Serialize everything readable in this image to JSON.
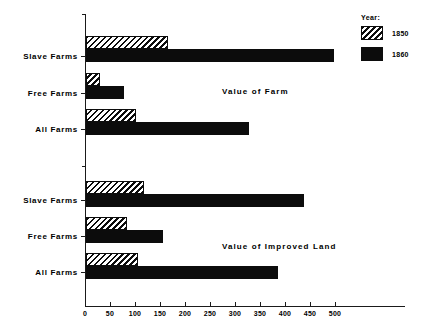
{
  "chart_data": {
    "type": "bar",
    "orientation": "horizontal",
    "title": "",
    "xlabel": "",
    "ylabel": "",
    "xlim": [
      0,
      515
    ],
    "grid": false,
    "legend": {
      "title": "Year:",
      "position": "top-right",
      "entries": [
        {
          "name": "1850",
          "pattern": "diagonal-hatch"
        },
        {
          "name": "1860",
          "pattern": "solid-black"
        }
      ]
    },
    "xticks": [
      0,
      50,
      100,
      150,
      200,
      250,
      300,
      350,
      400,
      450,
      500
    ],
    "xticklabels": [
      "0",
      "50",
      "100",
      "150",
      "200",
      "250",
      "300",
      "350",
      "400",
      "450",
      "500"
    ],
    "panels": [
      {
        "caption": "Value of Farm",
        "categories": [
          "Slave Farms",
          "Free Farms",
          "All Farms"
        ],
        "series": [
          {
            "name": "1850",
            "values": [
              164,
              28,
              100
            ]
          },
          {
            "name": "1860",
            "values": [
              495,
              76,
              325
            ]
          }
        ]
      },
      {
        "caption": "Value of Improved Land",
        "categories": [
          "Slave Farms",
          "Free Farms",
          "All Farms"
        ],
        "series": [
          {
            "name": "1850",
            "values": [
              116,
              82,
              104
            ]
          },
          {
            "name": "1860",
            "values": [
              435,
              154,
              384
            ]
          }
        ]
      }
    ]
  }
}
